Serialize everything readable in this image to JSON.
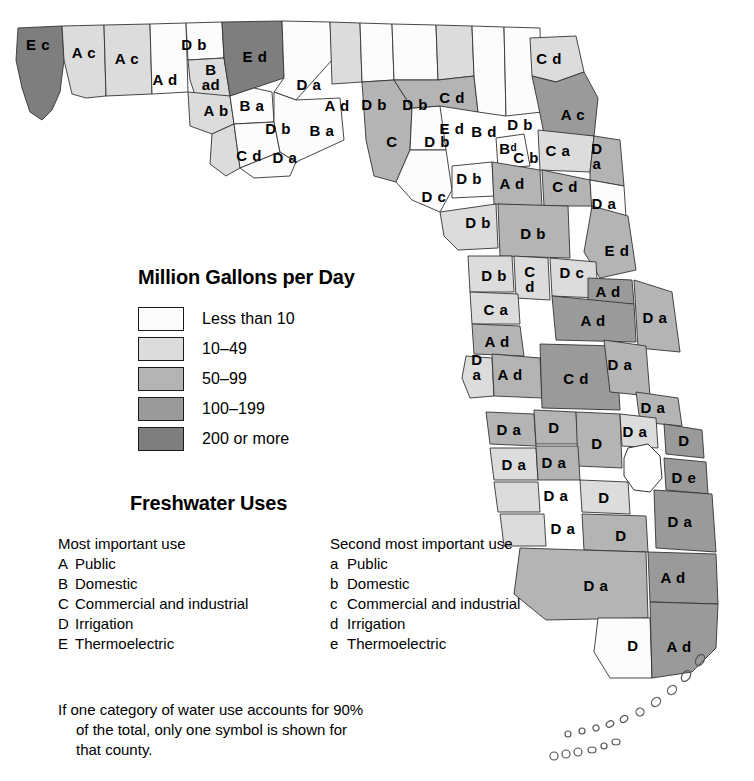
{
  "legend": {
    "title": "Million Gallons per Day",
    "classes": [
      {
        "label": "Less than 10",
        "color": "#fcfcfc"
      },
      {
        "label": "10–49",
        "color": "#dcdcdc"
      },
      {
        "label": "50–99",
        "color": "#b4b4b4"
      },
      {
        "label": "100–199",
        "color": "#9a9a9a"
      },
      {
        "label": "200 or more",
        "color": "#7e7e7e"
      }
    ]
  },
  "uses": {
    "title": "Freshwater Uses",
    "primary": {
      "heading": "Most important use",
      "items": [
        {
          "key": "A",
          "label": "Public"
        },
        {
          "key": "B",
          "label": "Domestic"
        },
        {
          "key": "C",
          "label": "Commercial and industrial"
        },
        {
          "key": "D",
          "label": "Irrigation"
        },
        {
          "key": "E",
          "label": "Thermoelectric"
        }
      ]
    },
    "secondary": {
      "heading": "Second most important use",
      "items": [
        {
          "key": "a",
          "label": "Public"
        },
        {
          "key": "b",
          "label": "Domestic"
        },
        {
          "key": "c",
          "label": "Commercial and industrial"
        },
        {
          "key": "d",
          "label": "Irrigation"
        },
        {
          "key": "e",
          "label": "Thermoelectric"
        }
      ]
    },
    "note_line1": "If one category of water use accounts for 90%",
    "note_line2": "of the total, only one symbol is shown for",
    "note_line3": "that county."
  },
  "chart_data": {
    "type": "map",
    "title": "Million Gallons per Day",
    "subtitle": "Freshwater Uses",
    "region": "Florida counties",
    "legend_classes": [
      "Less than 10",
      "10–49",
      "50–99",
      "100–199",
      "200 or more"
    ],
    "class_colors": [
      "#fcfcfc",
      "#dcdcdc",
      "#b4b4b4",
      "#9a9a9a",
      "#7e7e7e"
    ],
    "code_meanings": {
      "A": "Public",
      "B": "Domestic",
      "C": "Commercial and industrial",
      "D": "Irrigation",
      "E": "Thermoelectric",
      "a": "Public",
      "b": "Domestic",
      "c": "Commercial and industrial",
      "d": "Irrigation",
      "e": "Thermoelectric"
    },
    "counties": [
      {
        "code": "E c",
        "class": 4,
        "x": 38,
        "y": 44
      },
      {
        "code": "A c",
        "class": 1,
        "x": 84,
        "y": 52
      },
      {
        "code": "A c",
        "class": 1,
        "x": 127,
        "y": 58
      },
      {
        "code": "A d",
        "class": 0,
        "x": 165,
        "y": 79
      },
      {
        "code": "D b",
        "class": 0,
        "x": 194,
        "y": 44
      },
      {
        "code": "B\nad",
        "class": 1,
        "x": 211,
        "y": 78
      },
      {
        "code": "E d",
        "class": 4,
        "x": 255,
        "y": 56
      },
      {
        "code": "A b",
        "class": 1,
        "x": 216,
        "y": 110
      },
      {
        "code": "B a",
        "class": 0,
        "x": 252,
        "y": 105
      },
      {
        "code": "D b",
        "class": 0,
        "x": 278,
        "y": 128
      },
      {
        "code": "C d",
        "class": 1,
        "x": 249,
        "y": 155
      },
      {
        "code": "D a",
        "class": 1,
        "x": 285,
        "y": 157
      },
      {
        "code": "D a",
        "class": 0,
        "x": 309,
        "y": 84
      },
      {
        "code": "B a",
        "class": 0,
        "x": 322,
        "y": 130
      },
      {
        "code": "A d",
        "class": 1,
        "x": 337,
        "y": 105
      },
      {
        "code": "D b",
        "class": 0,
        "x": 374,
        "y": 104
      },
      {
        "code": "D b",
        "class": 0,
        "x": 415,
        "y": 104
      },
      {
        "code": "C",
        "class": 2,
        "x": 392,
        "y": 141
      },
      {
        "code": "D b",
        "class": 0,
        "x": 437,
        "y": 141
      },
      {
        "code": "D c",
        "class": 0,
        "x": 434,
        "y": 196
      },
      {
        "code": "C d",
        "class": 1,
        "x": 452,
        "y": 97
      },
      {
        "code": "E d",
        "class": 2,
        "x": 452,
        "y": 128
      },
      {
        "code": "B d",
        "class": 0,
        "x": 484,
        "y": 131
      },
      {
        "code": "D b",
        "class": 0,
        "x": 520,
        "y": 124
      },
      {
        "code": "Bᵈ",
        "class": 0,
        "x": 508,
        "y": 148
      },
      {
        "code": "C b",
        "class": 0,
        "x": 526,
        "y": 157
      },
      {
        "code": "C d",
        "class": 1,
        "x": 549,
        "y": 58
      },
      {
        "code": "A c",
        "class": 3,
        "x": 573,
        "y": 114
      },
      {
        "code": "C a",
        "class": 1,
        "x": 558,
        "y": 150
      },
      {
        "code": "D\na",
        "class": 2,
        "x": 597,
        "y": 157
      },
      {
        "code": "D b",
        "class": 0,
        "x": 469,
        "y": 178
      },
      {
        "code": "A d",
        "class": 2,
        "x": 512,
        "y": 183
      },
      {
        "code": "C d",
        "class": 2,
        "x": 565,
        "y": 186
      },
      {
        "code": "D a",
        "class": 0,
        "x": 604,
        "y": 203
      },
      {
        "code": "D b",
        "class": 1,
        "x": 478,
        "y": 222
      },
      {
        "code": "D b",
        "class": 2,
        "x": 533,
        "y": 233
      },
      {
        "code": "E d",
        "class": 2,
        "x": 617,
        "y": 250
      },
      {
        "code": "D b",
        "class": 1,
        "x": 494,
        "y": 275
      },
      {
        "code": "C\nd",
        "class": 1,
        "x": 530,
        "y": 280
      },
      {
        "code": "D c",
        "class": 1,
        "x": 572,
        "y": 272
      },
      {
        "code": "A d",
        "class": 3,
        "x": 608,
        "y": 291
      },
      {
        "code": "C a",
        "class": 1,
        "x": 496,
        "y": 309
      },
      {
        "code": "A d",
        "class": 3,
        "x": 593,
        "y": 320
      },
      {
        "code": "D a",
        "class": 2,
        "x": 655,
        "y": 317
      },
      {
        "code": "A d",
        "class": 2,
        "x": 497,
        "y": 341
      },
      {
        "code": "D\na",
        "class": 2,
        "x": 477,
        "y": 368
      },
      {
        "code": "A d",
        "class": 2,
        "x": 510,
        "y": 374
      },
      {
        "code": "C d",
        "class": 3,
        "x": 576,
        "y": 378
      },
      {
        "code": "D a",
        "class": 2,
        "x": 620,
        "y": 364
      },
      {
        "code": "D a",
        "class": 2,
        "x": 653,
        "y": 407
      },
      {
        "code": "D a",
        "class": 2,
        "x": 509,
        "y": 429
      },
      {
        "code": "D",
        "class": 2,
        "x": 554,
        "y": 427
      },
      {
        "code": "D",
        "class": 2,
        "x": 597,
        "y": 443
      },
      {
        "code": "D a",
        "class": 1,
        "x": 635,
        "y": 431
      },
      {
        "code": "D",
        "class": 3,
        "x": 684,
        "y": 440
      },
      {
        "code": "D a",
        "class": 1,
        "x": 514,
        "y": 464
      },
      {
        "code": "D a",
        "class": 2,
        "x": 554,
        "y": 462
      },
      {
        "code": "D e",
        "class": 3,
        "x": 684,
        "y": 477
      },
      {
        "code": "D a",
        "class": 2,
        "x": 556,
        "y": 495
      },
      {
        "code": "D",
        "class": 2,
        "x": 604,
        "y": 497
      },
      {
        "code": "D a",
        "class": 3,
        "x": 680,
        "y": 521
      },
      {
        "code": "D a",
        "class": 2,
        "x": 563,
        "y": 528
      },
      {
        "code": "D",
        "class": 2,
        "x": 621,
        "y": 535
      },
      {
        "code": "D a",
        "class": 3,
        "x": 596,
        "y": 585
      },
      {
        "code": "A d",
        "class": 3,
        "x": 673,
        "y": 577
      },
      {
        "code": "D",
        "class": 0,
        "x": 633,
        "y": 645
      },
      {
        "code": "A d",
        "class": 3,
        "x": 679,
        "y": 646
      }
    ]
  }
}
